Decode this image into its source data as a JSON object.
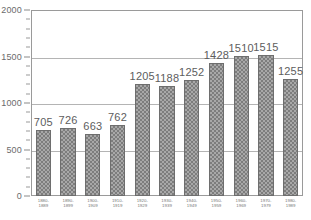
{
  "chart_data": {
    "type": "bar",
    "title": "",
    "subtitle": "",
    "xlabel": "",
    "ylabel": "",
    "categories": [
      "1880-1889",
      "1890-1899",
      "1900-1909",
      "1910-1919",
      "1920-1929",
      "1930-1939",
      "1940-1949",
      "1950-1959",
      "1960-1969",
      "1970-1979",
      "1980-1989"
    ],
    "category_lines": [
      [
        "1880-",
        "1889"
      ],
      [
        "1890-",
        "1899"
      ],
      [
        "1900-",
        "1909"
      ],
      [
        "1910-",
        "1919"
      ],
      [
        "1920-",
        "1929"
      ],
      [
        "1930-",
        "1939"
      ],
      [
        "1940-",
        "1949"
      ],
      [
        "1950-",
        "1959"
      ],
      [
        "1960-",
        "1969"
      ],
      [
        "1970-",
        "1979"
      ],
      [
        "1980-",
        "1989"
      ]
    ],
    "values": [
      705,
      726,
      663,
      762,
      1205,
      1188,
      1252,
      1428,
      1510,
      1515,
      1255
    ],
    "value_labels": [
      "705",
      "726",
      "663",
      "762",
      "1205",
      "1188",
      "1252",
      "1428",
      "1510",
      "1515",
      "1255"
    ],
    "ylim": [
      0,
      2000
    ],
    "ytick_labels": [
      "0",
      "500",
      "1000",
      "1500",
      "2000"
    ],
    "ytick_values": [
      0,
      500,
      1000,
      1500,
      2000
    ],
    "yminor_step": 100,
    "grid": true,
    "gridlines_at": [
      500,
      1000,
      1500
    ],
    "legend": null,
    "legend_position": "none",
    "colors": {
      "bar_fill": "#a8a8a8",
      "bar_hatch": "#7d7d7d",
      "bar_edge": "#6e6e6e",
      "grid": "#b4b4b4",
      "frame": "#9a9a9a",
      "axis_text": "#6b6b6b",
      "value_text": "#5d5d5d",
      "background": "#ffffff"
    }
  }
}
